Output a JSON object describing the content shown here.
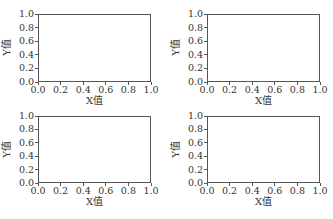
{
  "chart_data": [
    {
      "type": "line",
      "title": "",
      "xlabel": "X值",
      "ylabel": "Y值",
      "xlim": [
        0,
        1
      ],
      "ylim": [
        0,
        1
      ],
      "xticks": [
        "0.0",
        "0.2",
        "0.4",
        "0.6",
        "0.8",
        "1.0"
      ],
      "yticks": [
        "0.0",
        "0.2",
        "0.4",
        "0.6",
        "0.8",
        "1.0"
      ],
      "series": [],
      "grid": false,
      "position": "top-left"
    },
    {
      "type": "line",
      "title": "",
      "xlabel": "X值",
      "ylabel": "Y值",
      "xlim": [
        0,
        1
      ],
      "ylim": [
        0,
        1
      ],
      "xticks": [
        "0.0",
        "0.2",
        "0.4",
        "0.6",
        "0.8",
        "1.0"
      ],
      "yticks": [
        "0.0",
        "0.2",
        "0.4",
        "0.6",
        "0.8",
        "1.0"
      ],
      "series": [],
      "grid": false,
      "position": "top-right"
    },
    {
      "type": "line",
      "title": "",
      "xlabel": "X值",
      "ylabel": "Y值",
      "xlim": [
        0,
        1
      ],
      "ylim": [
        0,
        1
      ],
      "xticks": [
        "0.0",
        "0.2",
        "0.4",
        "0.6",
        "0.8",
        "1.0"
      ],
      "yticks": [
        "0.0",
        "0.2",
        "0.4",
        "0.6",
        "0.8",
        "1.0"
      ],
      "series": [],
      "grid": false,
      "position": "bottom-left"
    },
    {
      "type": "line",
      "title": "",
      "xlabel": "X值",
      "ylabel": "Y值",
      "xlim": [
        0,
        1
      ],
      "ylim": [
        0,
        1
      ],
      "xticks": [
        "0.0",
        "0.2",
        "0.4",
        "0.6",
        "0.8",
        "1.0"
      ],
      "yticks": [
        "0.0",
        "0.2",
        "0.4",
        "0.6",
        "0.8",
        "1.0"
      ],
      "series": [],
      "grid": false,
      "position": "bottom-right"
    }
  ]
}
